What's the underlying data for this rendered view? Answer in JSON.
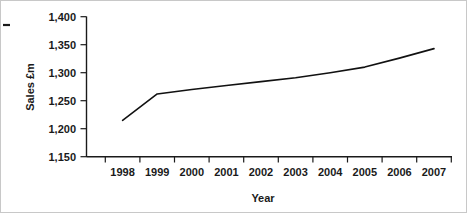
{
  "chart_data": {
    "type": "line",
    "title": "",
    "xlabel": "Year",
    "ylabel": "Sales £m",
    "categories": [
      "1998",
      "1999",
      "2000",
      "2001",
      "2002",
      "2003",
      "2004",
      "2005",
      "2006",
      "2007"
    ],
    "x": [
      1998,
      1999,
      2000,
      2001,
      2002,
      2003,
      2004,
      2005,
      2006,
      2007
    ],
    "series": [
      {
        "name": "Sales £m",
        "values": [
          1215,
          1262,
          1270,
          1277,
          1284,
          1291,
          1300,
          1310,
          1326,
          1343
        ],
        "color": "#111111"
      }
    ],
    "values": [
      1215,
      1262,
      1270,
      1277,
      1284,
      1291,
      1300,
      1310,
      1326,
      1343
    ],
    "ylim": [
      1150,
      1400
    ],
    "yticks": [
      1150,
      1200,
      1250,
      1300,
      1350,
      1400
    ],
    "ytick_labels": [
      "1,150",
      "1,200",
      "1,250",
      "1,300",
      "1,350",
      "1,400"
    ],
    "xtick_labels": [
      "1998",
      "1999",
      "2000",
      "2001",
      "2002",
      "2003",
      "2004",
      "2005",
      "2006",
      "2007"
    ],
    "grid": false,
    "legend": "none",
    "line_color": "#111111"
  },
  "axes": {
    "y_label": "Sales £m",
    "x_label": "Year"
  }
}
